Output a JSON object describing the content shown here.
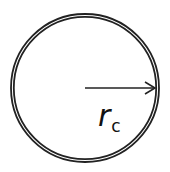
{
  "diagram": {
    "circle": {
      "cx": 85,
      "cy": 88,
      "r_outer": 74,
      "r_inner": 71,
      "stroke": "#222222"
    },
    "arrow": {
      "x1": 85,
      "y1": 88,
      "x2": 155,
      "y2": 88
    },
    "label": {
      "main": "r",
      "subscript": "c"
    }
  }
}
